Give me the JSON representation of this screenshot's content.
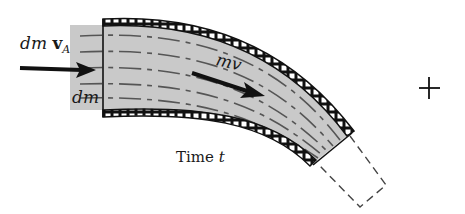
{
  "diagram": {
    "labels": {
      "inflow_momentum": {
        "prefix": "dm ",
        "vector": "v",
        "subscript": "A"
      },
      "inflow_mass": "dm",
      "system_momentum": "mv",
      "time_caption": {
        "text": "Time ",
        "variable": "t"
      },
      "operator": "+"
    },
    "colors": {
      "fluid_fill": "#c9c9c9",
      "ink": "#111111",
      "background": "#ffffff",
      "streamline": "#555555"
    }
  }
}
